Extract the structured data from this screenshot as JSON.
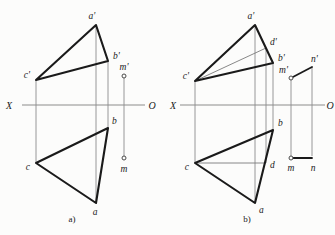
{
  "figure": {
    "background_color": "#fcfcfb",
    "thick_line_color": "#1a1a1a",
    "thin_line_color": "#8c8c8c",
    "axis_color": "#8c8c8c"
  },
  "panel_a": {
    "caption": "a)",
    "axis": {
      "left_label": "X",
      "right_label": "O",
      "y": 105,
      "x_start": 22,
      "x_end": 145
    },
    "points": [
      {
        "id": "a-prime",
        "label": "a'",
        "x": 96,
        "y": 25,
        "label_x": 92,
        "label_y": 19
      },
      {
        "id": "b-prime",
        "label": "b'",
        "x": 108,
        "y": 61,
        "label_x": 112,
        "label_y": 59
      },
      {
        "id": "c-prime",
        "label": "c'",
        "x": 36,
        "y": 80,
        "label_x": 26,
        "label_y": 78
      },
      {
        "id": "a",
        "label": "a",
        "x": 96,
        "y": 203,
        "label_x": 93,
        "label_y": 214
      },
      {
        "id": "b",
        "label": "b",
        "x": 108,
        "y": 128,
        "label_x": 111,
        "label_y": 124
      },
      {
        "id": "c",
        "label": "c",
        "x": 36,
        "y": 163,
        "label_x": 26,
        "label_y": 169
      },
      {
        "id": "m-prime",
        "label": "m'",
        "x": 124,
        "y": 76,
        "label_x": 119,
        "label_y": 70
      },
      {
        "id": "m",
        "label": "m",
        "x": 124,
        "y": 158,
        "label_x": 120,
        "label_y": 171
      }
    ],
    "upper_triangle": "a'b'c'",
    "lower_triangle": "abc"
  },
  "panel_b": {
    "caption": "b)",
    "axis": {
      "left_label": "X",
      "right_label": "O",
      "y": 105,
      "x_start": 180,
      "x_end": 325
    },
    "points": [
      {
        "id": "a-prime",
        "label": "a'",
        "x": 255,
        "y": 25,
        "label_x": 251,
        "label_y": 19
      },
      {
        "id": "d-prime",
        "label": "d'",
        "x": 266,
        "y": 48,
        "label_x": 270,
        "label_y": 45
      },
      {
        "id": "b-prime",
        "label": "b'",
        "x": 273,
        "y": 63,
        "label_x": 277,
        "label_y": 61
      },
      {
        "id": "c-prime",
        "label": "c'",
        "x": 195,
        "y": 81,
        "label_x": 185,
        "label_y": 79
      },
      {
        "id": "a",
        "label": "a",
        "x": 255,
        "y": 203,
        "label_x": 257,
        "label_y": 212
      },
      {
        "id": "b",
        "label": "b",
        "x": 273,
        "y": 130,
        "label_x": 277,
        "label_y": 126
      },
      {
        "id": "c",
        "label": "c",
        "x": 195,
        "y": 163,
        "label_x": 185,
        "label_y": 169
      },
      {
        "id": "d",
        "label": "d",
        "x": 266,
        "y": 163,
        "label_x": 270,
        "label_y": 168
      },
      {
        "id": "m-prime",
        "label": "m'",
        "x": 291,
        "y": 78,
        "label_x": 283,
        "label_y": 74
      },
      {
        "id": "n-prime",
        "label": "n'",
        "x": 312,
        "y": 67,
        "label_x": 313,
        "label_y": 62
      },
      {
        "id": "m",
        "label": "m",
        "x": 291,
        "y": 158,
        "label_x": 287,
        "label_y": 169
      },
      {
        "id": "n",
        "label": "n",
        "x": 312,
        "y": 158,
        "label_x": 310,
        "label_y": 169
      }
    ],
    "upper_triangle": "a'b'c'",
    "lower_triangle": "abc",
    "auxiliary_line_upper": "c'd'",
    "auxiliary_line_lower": "cd"
  }
}
